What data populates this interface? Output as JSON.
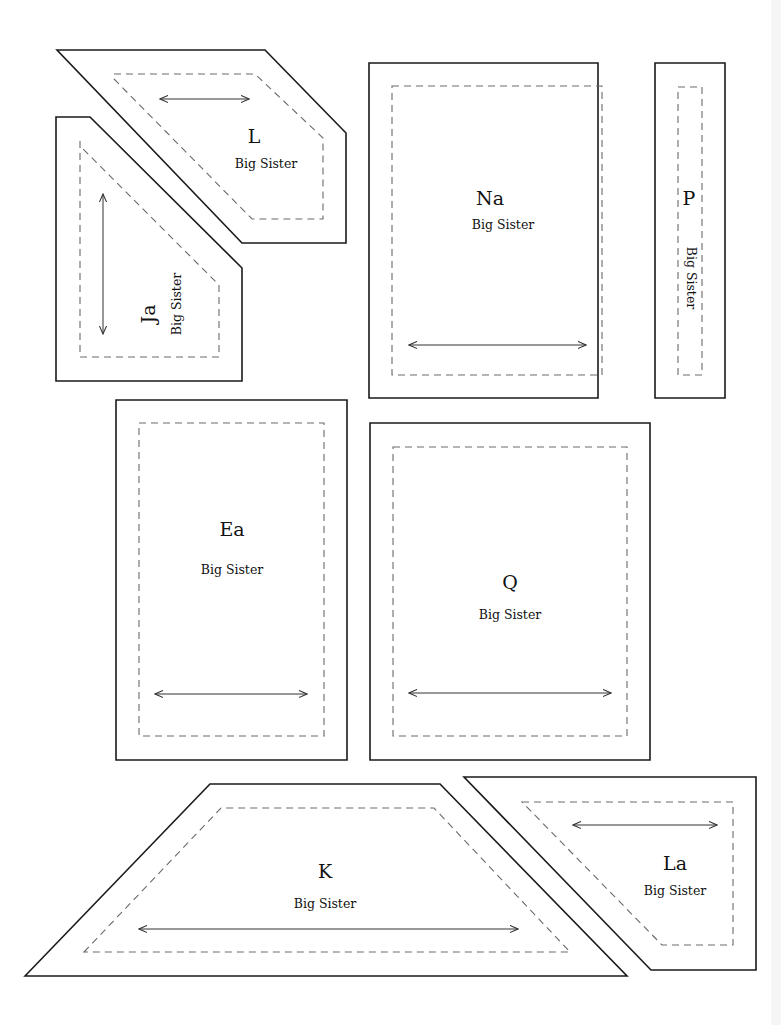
{
  "sheet": {
    "width": 781,
    "height": 1025,
    "background": "#ffffff",
    "outline_color": "#1a1a1a",
    "seam_color": "#6a6a6a"
  },
  "pieces": [
    {
      "id": "L",
      "letter": "L",
      "subtitle": "Big Sister",
      "outer": "57,50 265,50 346,133 346,243 242,243",
      "seam": "114,74 255,74 323,138 323,219 252,219 114,79",
      "grain": {
        "x1": 160,
        "y1": 99,
        "x2": 249,
        "y2": 99
      },
      "letter_pos": {
        "x": 254,
        "y": 138,
        "rotate": 0
      },
      "subtitle_pos": {
        "x": 266,
        "y": 164,
        "rotate": 0
      }
    },
    {
      "id": "Ja",
      "letter": "Ja",
      "subtitle": "Big Sister",
      "outer": "56,117 90,117 242,268 242,381 56,381",
      "seam": "80,141 80,357 219,357 219,285 80,146",
      "grain": {
        "x1": 103,
        "y1": 194,
        "x2": 103,
        "y2": 334
      },
      "letter_pos": {
        "x": 150,
        "y": 314,
        "rotate": -90
      },
      "subtitle_pos": {
        "x": 177,
        "y": 304,
        "rotate": -90
      }
    },
    {
      "id": "Na",
      "letter": "Na",
      "subtitle": "Big Sister",
      "outer": "369,63 598,63 598,398 369,398",
      "seam": "392,86 602,86 602,375 392,375",
      "grain": {
        "x1": 409,
        "y1": 345,
        "x2": 586,
        "y2": 345
      },
      "letter_pos": {
        "x": 490,
        "y": 200,
        "rotate": 0
      },
      "subtitle_pos": {
        "x": 503,
        "y": 225,
        "rotate": 0
      }
    },
    {
      "id": "P",
      "letter": "P",
      "subtitle": "Big Sister",
      "outer": "655,63 725,63 725,398 655,398",
      "seam": "678,87 702,87 702,375 678,375",
      "grain": null,
      "letter_pos": {
        "x": 689,
        "y": 200,
        "rotate": 0
      },
      "subtitle_pos": {
        "x": 690,
        "y": 278,
        "rotate": 90
      }
    },
    {
      "id": "Ea",
      "letter": "Ea",
      "subtitle": "Big Sister",
      "outer": "116,400 347,400 347,760 116,760",
      "seam": "139,423 324,423 324,736 139,736",
      "grain": {
        "x1": 155,
        "y1": 694,
        "x2": 307,
        "y2": 694
      },
      "letter_pos": {
        "x": 232,
        "y": 531,
        "rotate": 0
      },
      "subtitle_pos": {
        "x": 232,
        "y": 570,
        "rotate": 0
      }
    },
    {
      "id": "Q",
      "letter": "Q",
      "subtitle": "Big Sister",
      "outer": "370,423 650,423 650,760 370,760",
      "seam": "393,447 627,447 627,736 393,736",
      "grain": {
        "x1": 409,
        "y1": 693,
        "x2": 611,
        "y2": 693
      },
      "letter_pos": {
        "x": 510,
        "y": 584,
        "rotate": 0
      },
      "subtitle_pos": {
        "x": 510,
        "y": 615,
        "rotate": 0
      }
    },
    {
      "id": "K",
      "letter": "K",
      "subtitle": "Big Sister",
      "outer": "25,976 210,784 440,784 627,976",
      "seam": "84,952 221,808 434,808 570,952",
      "grain": {
        "x1": 139,
        "y1": 929,
        "x2": 518,
        "y2": 929
      },
      "letter_pos": {
        "x": 325,
        "y": 873,
        "rotate": 0
      },
      "subtitle_pos": {
        "x": 325,
        "y": 904,
        "rotate": 0
      }
    },
    {
      "id": "La",
      "letter": "La",
      "subtitle": "Big Sister",
      "outer": "464,777 756,777 756,970 651,970",
      "seam": "522,802 733,802 733,945 662,945",
      "grain": {
        "x1": 573,
        "y1": 825,
        "x2": 717,
        "y2": 825
      },
      "letter_pos": {
        "x": 675,
        "y": 865,
        "rotate": 0
      },
      "subtitle_pos": {
        "x": 675,
        "y": 891,
        "rotate": 0
      }
    }
  ]
}
